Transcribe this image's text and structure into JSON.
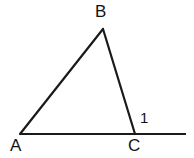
{
  "figure": {
    "kind": "geometry-diagram",
    "width": 194,
    "height": 158,
    "background_color": "#ffffff",
    "stroke_color": "#1a1a1a",
    "stroke_width": 2.2,
    "labels": {
      "vertex_a": "A",
      "vertex_b": "B",
      "vertex_c": "C",
      "angle_1": "1"
    },
    "points": {
      "A": {
        "x": 20,
        "y": 134
      },
      "B": {
        "x": 103,
        "y": 29
      },
      "C": {
        "x": 135,
        "y": 134
      },
      "ray_end": {
        "x": 186,
        "y": 134
      }
    },
    "segments": [
      {
        "name": "AB",
        "from": "A",
        "to": "B"
      },
      {
        "name": "BC",
        "from": "B",
        "to": "C"
      },
      {
        "name": "A-ray",
        "from": "A",
        "to": "ray_end"
      }
    ]
  }
}
